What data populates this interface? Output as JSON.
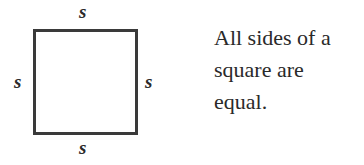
{
  "diagram": {
    "shape": "square",
    "side_labels": {
      "top": "s",
      "bottom": "s",
      "left": "s",
      "right": "s"
    },
    "stroke_color": "#3a3a3a"
  },
  "caption": {
    "lines": [
      "All sides of a",
      "square are",
      "equal."
    ]
  }
}
